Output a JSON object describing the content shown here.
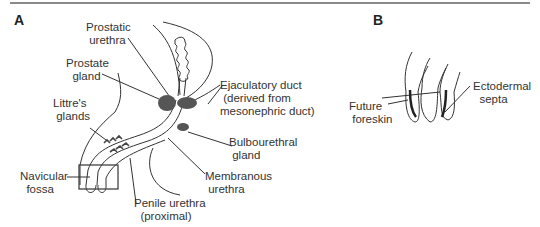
{
  "figure": {
    "panel_a": {
      "letter": "A",
      "labels": {
        "prostatic_urethra": "Prostatic\n urethra",
        "prostate_gland": "Prostate\n  gland",
        "ejaculatory_duct": "Ejaculatory duct\n (derived from\nmesonephric duct)",
        "littres_glands": "Littre's\n glands",
        "bulbourethral_gland": "Bulbourethral\n gland",
        "navicular_fossa": "Navicular\n  fossa",
        "membranous_urethra": "Membranous\n urethra",
        "penile_urethra": "Penile urethra\n  (proximal)"
      }
    },
    "panel_b": {
      "letter": "B",
      "labels": {
        "future_foreskin": "Future\n foreskin",
        "ectodermal_septa": "Ectodermal\n  septa"
      }
    }
  }
}
